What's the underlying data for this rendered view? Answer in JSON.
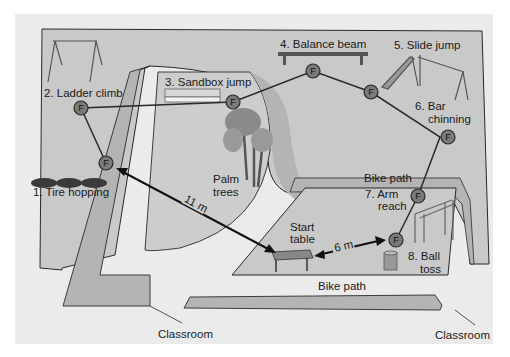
{
  "diagram": {
    "title": "",
    "stations": [
      {
        "id": 1,
        "label": "1. Tire hopping"
      },
      {
        "id": 2,
        "label": "2. Ladder climb"
      },
      {
        "id": 3,
        "label": "3. Sandbox jump"
      },
      {
        "id": 4,
        "label": "4. Balance beam"
      },
      {
        "id": 5,
        "label": "5. Slide jump"
      },
      {
        "id": 6,
        "label_line1": "6. Bar",
        "label_line2": "chinning"
      },
      {
        "id": 7,
        "label_line1": "7. Arm",
        "label_line2": "reach"
      },
      {
        "id": 8,
        "label_line1": "8. Ball",
        "label_line2": "toss"
      }
    ],
    "node_marker": "F",
    "palm_trees": {
      "line1": "Palm",
      "line2": "trees"
    },
    "start_table": {
      "line1": "Start",
      "line2": "table"
    },
    "distances": {
      "long": "11 m",
      "short": "6 m"
    },
    "bike_path_upper": "Bike path",
    "bike_path_lower": "Bike path",
    "classroom_left": "Classroom",
    "classroom_right": "Classroom"
  },
  "colors": {
    "background": "#ebebeb",
    "field": "#c9c9c9",
    "path_band": "#b4b4b4",
    "node_fill": "#7a7a7a",
    "outline": "#2a2a2a"
  }
}
